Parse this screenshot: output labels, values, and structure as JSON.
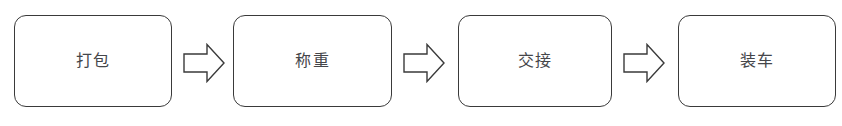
{
  "diagram": {
    "orientation": "horizontal",
    "background_color": "#ffffff",
    "node_border_color": "#3a3a3a",
    "node_fill_color": "#ffffff",
    "text_color": "#45464a",
    "arrow_icon_name": "right-block-arrow-icon",
    "nodes": [
      {
        "id": "node-1",
        "label": "打包",
        "x": 14,
        "width": 158
      },
      {
        "id": "node-2",
        "label": "称重",
        "x": 233,
        "width": 159
      },
      {
        "id": "node-3",
        "label": "交接",
        "x": 458,
        "width": 154
      },
      {
        "id": "node-4",
        "label": "装车",
        "x": 678,
        "width": 158
      }
    ],
    "connectors": [
      {
        "id": "connector-1",
        "from": "node-1",
        "to": "node-2",
        "x": 183
      },
      {
        "id": "connector-2",
        "from": "node-2",
        "to": "node-3",
        "x": 403
      },
      {
        "id": "connector-3",
        "from": "node-3",
        "to": "node-4",
        "x": 623
      }
    ]
  }
}
